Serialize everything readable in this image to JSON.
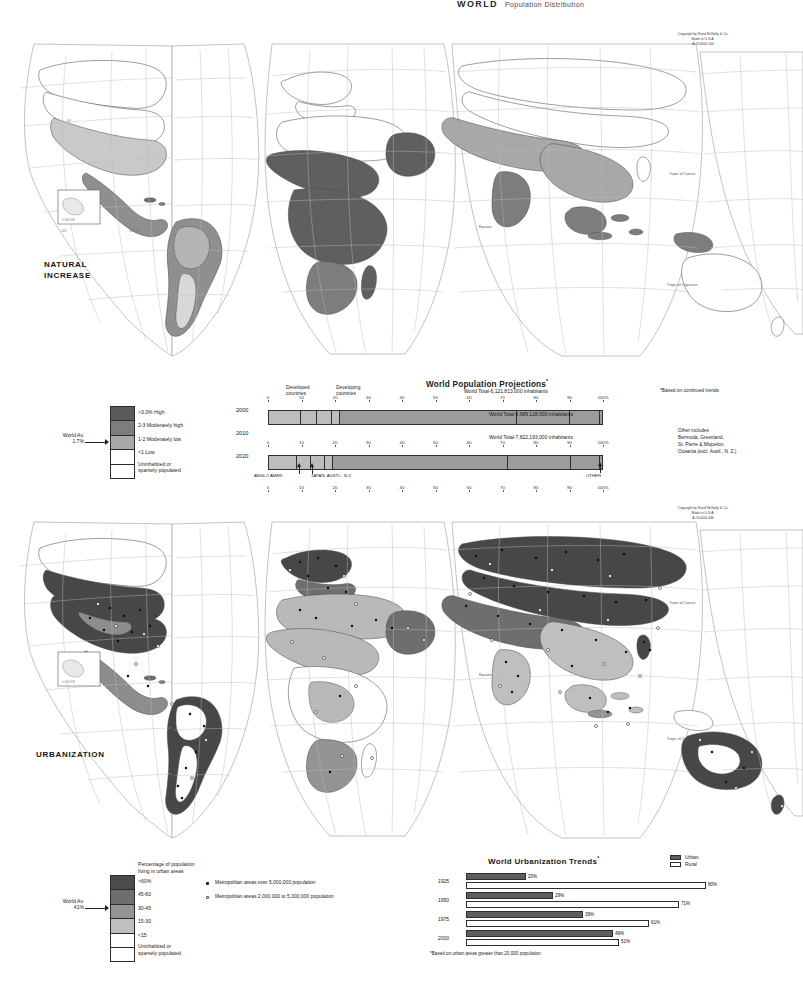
{
  "header": {
    "title": "WORLD",
    "subtitle": "Population Distribution"
  },
  "maps": [
    {
      "name": "natural-increase",
      "title_line1": "NATURAL",
      "title_line2": "INCREASE",
      "copyright": [
        "Copyright by Rand McNally & Co.",
        "Made in U.S.A.",
        "A-510000-104"
      ],
      "graticule_labels": [
        "Tropic of Cancer",
        "Equator",
        "Tropic of Capricorn"
      ],
      "legend": {
        "world_average_label": "World Av.",
        "world_average_value": "1.7%",
        "items": [
          {
            "label": ">3.0% High",
            "color": "#5b5b5b"
          },
          {
            "label": "2-3 Moderately high",
            "color": "#7d7d7d"
          },
          {
            "label": "1-2 Moderately low",
            "color": "#a8a8a8"
          },
          {
            "label": "<1 Low",
            "color": "#ffffff"
          },
          {
            "label": "Uninhabited or\nsparsely populated",
            "color": "#ffffff"
          }
        ]
      }
    },
    {
      "name": "urbanization",
      "title_line1": "URBANIZATION",
      "title_line2": "",
      "copyright": [
        "Copyright by Rand McNally & Co.",
        "Made in U.S.A.",
        "A-510000-346"
      ],
      "graticule_labels": [
        "Tropic of Cancer",
        "Equator",
        "Tropic of Capricorn"
      ],
      "legend": {
        "heading_line1": "Percentage of population",
        "heading_line2": "living in urban areas",
        "world_average_label": "World Av.",
        "world_average_value": "41%",
        "items": [
          {
            "label": ">60%",
            "color": "#4b4b4b"
          },
          {
            "label": "45-60",
            "color": "#6e6e6e"
          },
          {
            "label": "30-45",
            "color": "#949494"
          },
          {
            "label": "15-30",
            "color": "#bfbfbf"
          },
          {
            "label": "<15",
            "color": "#ffffff"
          },
          {
            "label": "Uninhabited or\nsparsely populated",
            "color": "#ffffff"
          }
        ],
        "symbols": [
          {
            "marker": "filled",
            "label": "Metropolitan areas over 5,000,000 population"
          },
          {
            "marker": "open",
            "label": "Metropolitan areas 2,000,000 to 5,000,000 population"
          }
        ]
      }
    }
  ],
  "projections": {
    "title": "World Population Projections",
    "title_asterisk": "*",
    "footnote": "*Based on continued trends",
    "group_label_developed_line1": "Developed",
    "group_label_developed_line2": "countries",
    "group_label_developing_line1": "Developing",
    "group_label_developing_line2": "countries",
    "axis_ticks": [
      "0",
      "10",
      "20",
      "30",
      "40",
      "50",
      "60",
      "70",
      "80",
      "90",
      "100%"
    ],
    "callouts": [
      "ANGLO AMER.",
      "JAPAN, AUSTL., N.Z.",
      "OTHER"
    ],
    "other_note": [
      "Other includes",
      "Bermuda, Greenland,",
      "St. Pierre & Miquelon,",
      "Oceania (excl. Austl., N. Z.)"
    ],
    "rows": [
      {
        "year": "2000",
        "total": "World Total-6,121,813,000 inhabitants",
        "segments": [
          {
            "label": "EUROPE",
            "pct": 9.5,
            "group": "developed"
          },
          {
            "label": "SOV. UN.",
            "pct": 4.8,
            "group": "developed"
          },
          {
            "label": "ANGLO AMER.",
            "pct": 4.6,
            "group": "developed"
          },
          {
            "label": "JAPAN, AUSTL., N.Z.",
            "pct": 2.5,
            "group": "developed"
          },
          {
            "label": "ASIA (excl. JAPAN)",
            "pct": 53.0,
            "group": "developing"
          },
          {
            "label": "AFRICA",
            "pct": 16.0,
            "group": "developing"
          },
          {
            "label": "LAT. AM.",
            "pct": 9.0,
            "group": "developing"
          },
          {
            "label": "OTHER",
            "pct": 0.6,
            "group": "developing"
          }
        ]
      },
      {
        "year": "2010",
        "total": "World Total-6,989,128,000 inhabitants",
        "segments": [
          {
            "label": "EUROPE",
            "pct": 8.3,
            "group": "developed"
          },
          {
            "label": "SOV. UN.",
            "pct": 4.3,
            "group": "developed"
          },
          {
            "label": "ANGLO AMER.",
            "pct": 4.3,
            "group": "developed"
          },
          {
            "label": "JAPAN, AUSTL., N.Z.",
            "pct": 2.3,
            "group": "developed"
          },
          {
            "label": "ASIA (excl. JAPAN)",
            "pct": 52.5,
            "group": "developing"
          },
          {
            "label": "AFRICA",
            "pct": 19.0,
            "group": "developing"
          },
          {
            "label": "LAT. AM.",
            "pct": 8.7,
            "group": "developing"
          },
          {
            "label": "OTHER",
            "pct": 0.6,
            "group": "developing"
          }
        ]
      },
      {
        "year": "2020",
        "total": "World Total-7,822,193,000 inhabitants",
        "segments": [
          {
            "label": "EUROPE",
            "pct": 7.3,
            "group": "developed"
          },
          {
            "label": "SOV. UN.",
            "pct": 4.0,
            "group": "developed"
          },
          {
            "label": "ANGLO AMER.",
            "pct": 3.9,
            "group": "developed"
          },
          {
            "label": "JAPAN, AUSTL., N.Z.",
            "pct": 2.1,
            "group": "developed"
          },
          {
            "label": "ASIA (excl. JAPAN)",
            "pct": 52.0,
            "group": "developing"
          },
          {
            "label": "AFRICA",
            "pct": 21.5,
            "group": "developing"
          },
          {
            "label": "LAT. AM.",
            "pct": 8.6,
            "group": "developing"
          },
          {
            "label": "OTHER",
            "pct": 0.6,
            "group": "developing"
          }
        ]
      }
    ]
  },
  "chart_data": [
    {
      "type": "bar",
      "orientation": "horizontal-stacked",
      "title": "World Population Projections *",
      "xlabel": "",
      "ylabel": "",
      "xlim": [
        0,
        100
      ],
      "tick_labels": [
        "0",
        "10",
        "20",
        "30",
        "40",
        "50",
        "60",
        "70",
        "80",
        "90",
        "100%"
      ],
      "grid": false,
      "legend": [
        "Developed countries",
        "Developing countries"
      ],
      "categories": [
        "2000",
        "2010",
        "2020"
      ],
      "region_order": [
        "EUROPE",
        "SOV. UN.",
        "ANGLO AMER.",
        "JAPAN, AUSTL., N.Z.",
        "ASIA (excl. JAPAN)",
        "AFRICA",
        "LAT. AM.",
        "OTHER"
      ],
      "series": [
        {
          "name": "EUROPE",
          "values": [
            9.5,
            8.3,
            7.3
          ]
        },
        {
          "name": "SOV. UN.",
          "values": [
            4.8,
            4.3,
            4.0
          ]
        },
        {
          "name": "ANGLO AMER.",
          "values": [
            4.6,
            4.3,
            3.9
          ]
        },
        {
          "name": "JAPAN, AUSTL., N.Z.",
          "values": [
            2.5,
            2.3,
            2.1
          ]
        },
        {
          "name": "ASIA (excl. JAPAN)",
          "values": [
            53.0,
            52.5,
            52.0
          ]
        },
        {
          "name": "AFRICA",
          "values": [
            16.0,
            19.0,
            21.5
          ]
        },
        {
          "name": "LAT. AM.",
          "values": [
            9.0,
            8.7,
            8.6
          ]
        },
        {
          "name": "OTHER",
          "values": [
            0.6,
            0.6,
            0.6
          ]
        }
      ],
      "annotations": [
        "World Total-6,121,813,000 inhabitants",
        "World Total-6,989,128,000 inhabitants",
        "World Total-7,822,193,000 inhabitants",
        "*Based on continued trends",
        "Other includes Bermuda, Greenland, St. Pierre & Miquelon, Oceania (excl. Austl., N. Z.)"
      ]
    },
    {
      "type": "bar",
      "orientation": "horizontal-paired",
      "title": "World  Urbanization Trends *",
      "xlabel": "",
      "ylabel": "",
      "xlim": [
        0,
        100
      ],
      "grid": false,
      "legend": [
        "Urban",
        "Rural"
      ],
      "legend_position": "top-right",
      "categories": [
        "1925",
        "1950",
        "1975",
        "2000"
      ],
      "series": [
        {
          "name": "Urban",
          "values": [
            20,
            29,
            39,
            49
          ],
          "labels": [
            "20%",
            "29%",
            "39%",
            "49%"
          ]
        },
        {
          "name": "Rural",
          "values": [
            80,
            71,
            61,
            51
          ],
          "labels": [
            "80%",
            "71%",
            "61%",
            "51%"
          ]
        }
      ],
      "annotations": [
        "*Based on urban areas greater than 20,000 population"
      ]
    }
  ],
  "urbanization_trends": {
    "title": "World  Urbanization Trends",
    "title_asterisk": "*",
    "legend": [
      {
        "label": "Urban",
        "color": "#5e5e5e"
      },
      {
        "label": "Rural",
        "color": "#ffffff"
      }
    ],
    "footnote": "*Based on urban areas greater than 20,000 population",
    "rows": [
      {
        "year": "1925",
        "urban": 20,
        "rural": 80,
        "urban_label": "20%",
        "rural_label": "80%"
      },
      {
        "year": "1950",
        "urban": 29,
        "rural": 71,
        "urban_label": "29%",
        "rural_label": "71%"
      },
      {
        "year": "1975",
        "urban": 39,
        "rural": 61,
        "urban_label": "39%",
        "rural_label": "61%"
      },
      {
        "year": "2000",
        "urban": 49,
        "rural": 51,
        "urban_label": "49%",
        "rural_label": "51%"
      }
    ]
  }
}
